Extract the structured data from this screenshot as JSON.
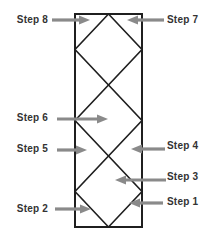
{
  "steps": [
    {
      "label": "Step 1",
      "side": "right",
      "arrow_direction": "left"
    },
    {
      "label": "Step 2",
      "side": "left",
      "arrow_direction": "right"
    },
    {
      "label": "Step 3",
      "side": "right",
      "arrow_direction": "left"
    },
    {
      "label": "Step 4",
      "side": "right",
      "arrow_direction": "left"
    },
    {
      "label": "Step 5",
      "side": "left",
      "arrow_direction": "right"
    },
    {
      "label": "Step 6",
      "side": "left",
      "arrow_direction": "right"
    },
    {
      "label": "Step 7",
      "side": "right",
      "arrow_direction": "left"
    },
    {
      "label": "Step 8",
      "side": "left",
      "arrow_direction": "right"
    }
  ],
  "colors": {
    "background": "#ffffff",
    "lattice_line": "#1f1f1f",
    "arrow": "#8a8a8a",
    "label_text": "#333333"
  }
}
